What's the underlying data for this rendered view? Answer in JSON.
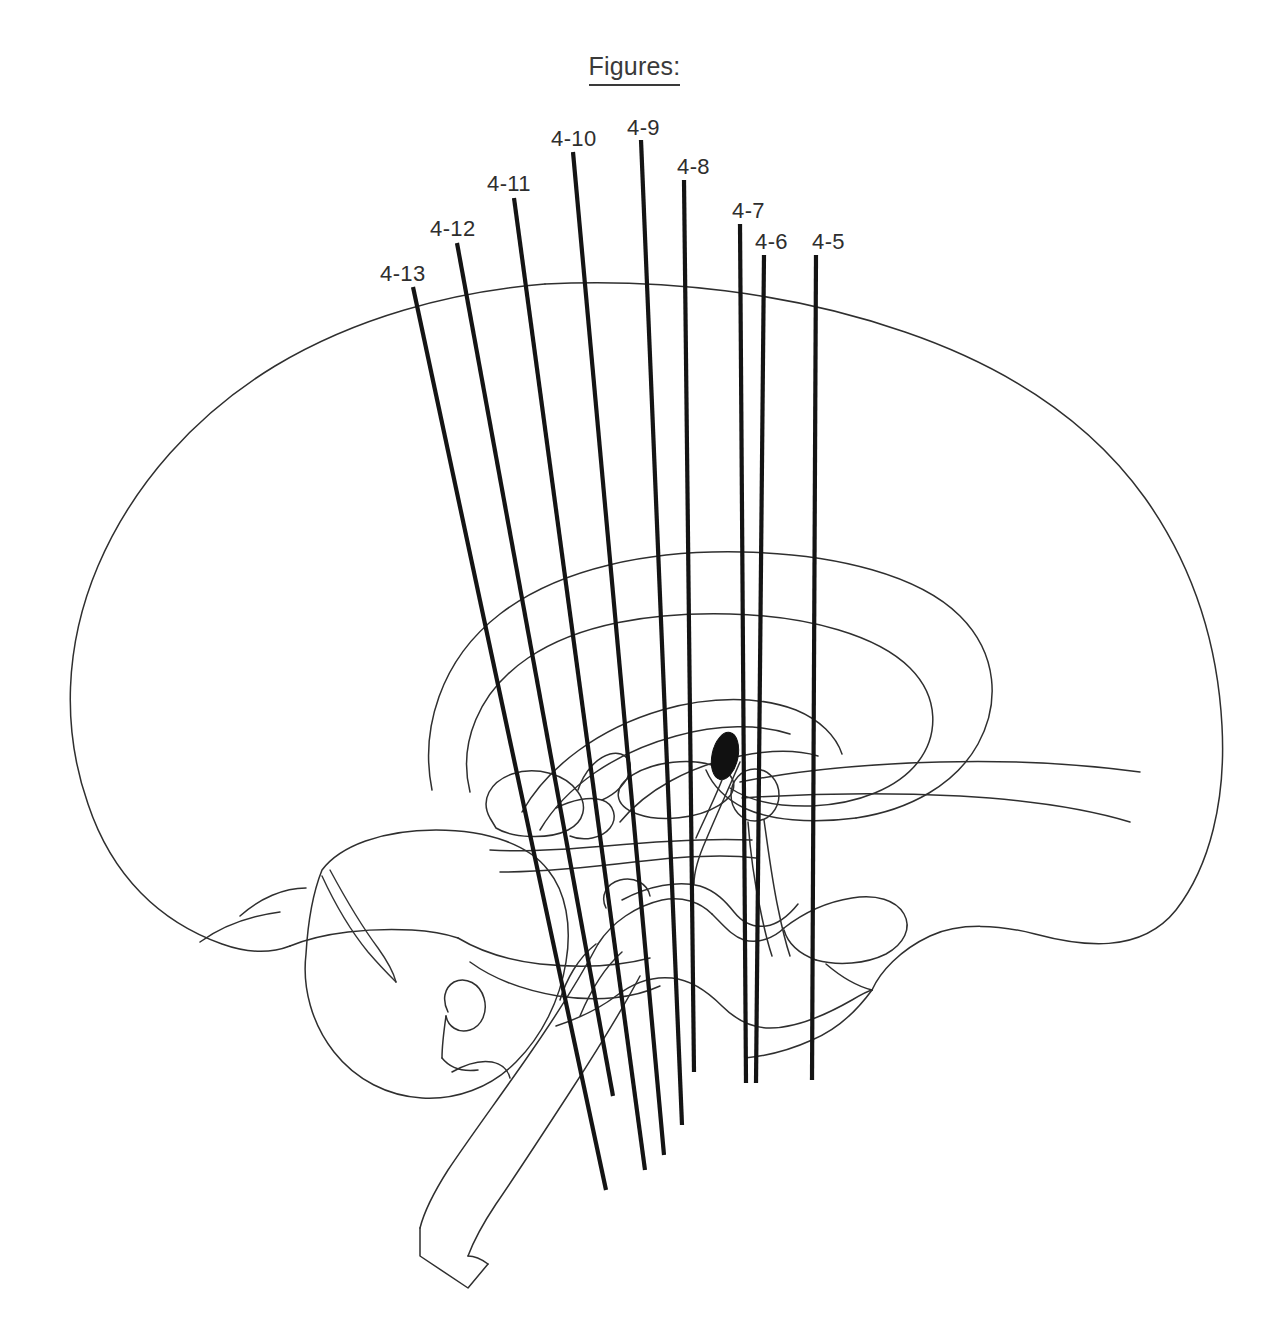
{
  "figure": {
    "title": "Figures:",
    "background_color": "#ffffff",
    "ink_color": "#2f2f2f",
    "section_line_color": "#141414",
    "type": "midsagittal brain diagram with coronal section planes"
  },
  "section_planes": [
    {
      "label": "4-13",
      "label_x": 380,
      "label_y": 263,
      "x1": 413,
      "y1": 287,
      "x2": 606,
      "y2": 1190
    },
    {
      "label": "4-12",
      "label_x": 430,
      "label_y": 218,
      "x1": 457,
      "y1": 243,
      "x2": 613,
      "y2": 1096
    },
    {
      "label": "4-11",
      "label_x": 487,
      "label_y": 173,
      "x1": 514,
      "y1": 198,
      "x2": 645,
      "y2": 1170
    },
    {
      "label": "4-10",
      "label_x": 551,
      "label_y": 128,
      "x1": 573,
      "y1": 152,
      "x2": 664,
      "y2": 1155
    },
    {
      "label": "4-9",
      "label_x": 627,
      "label_y": 117,
      "x1": 641,
      "y1": 140,
      "x2": 682,
      "y2": 1125
    },
    {
      "label": "4-8",
      "label_x": 677,
      "label_y": 156,
      "x1": 684,
      "y1": 180,
      "x2": 694,
      "y2": 1072
    },
    {
      "label": "4-7",
      "label_x": 732,
      "label_y": 200,
      "x1": 740,
      "y1": 224,
      "x2": 746,
      "y2": 1083
    },
    {
      "label": "4-6",
      "label_x": 755,
      "label_y": 231,
      "x1": 764,
      "y1": 255,
      "x2": 756,
      "y2": 1083
    },
    {
      "label": "4-5",
      "label_x": 812,
      "label_y": 231,
      "x1": 816,
      "y1": 255,
      "x2": 812,
      "y2": 1080
    }
  ],
  "structures": [
    {
      "name": "cerebral-cortex-outline"
    },
    {
      "name": "corpus-callosum"
    },
    {
      "name": "lateral-ventricle"
    },
    {
      "name": "thalamus"
    },
    {
      "name": "fornix"
    },
    {
      "name": "pineal-gland"
    },
    {
      "name": "midbrain"
    },
    {
      "name": "pons"
    },
    {
      "name": "medulla"
    },
    {
      "name": "cerebellum"
    },
    {
      "name": "optic-chiasm"
    },
    {
      "name": "pituitary-stalk"
    },
    {
      "name": "mammillary-body"
    },
    {
      "name": "temporal-lobe"
    },
    {
      "name": "brainstem"
    }
  ]
}
